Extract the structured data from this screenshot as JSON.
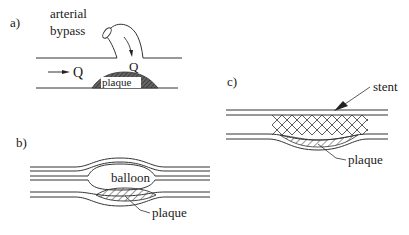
{
  "panels": {
    "a": {
      "label": "a)",
      "title_line1": "arterial",
      "title_line2": "bypass",
      "flow_label_main": "Q",
      "flow_label_bypass": "Q",
      "plaque_label": "plaque"
    },
    "b": {
      "label": "b)",
      "balloon_label": "balloon",
      "plaque_label": "plaque"
    },
    "c": {
      "label": "c)",
      "stent_label": "stent",
      "plaque_label": "plaque"
    }
  },
  "colors": {
    "line": "#333333",
    "plaque_fill_a": "#555555",
    "background": "#ffffff"
  }
}
